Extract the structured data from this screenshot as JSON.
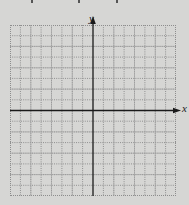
{
  "figure": {
    "type": "blank coordinate grid",
    "x_axis_label": "x",
    "y_axis_label": "y",
    "grid": {
      "columns": 16,
      "rows": 16,
      "line_style": "dotted",
      "bold_every": 2
    },
    "colors": {
      "background": "#d6d6d4",
      "grid_line": "#8d8d8d",
      "axis": "#1a1a1a"
    }
  }
}
